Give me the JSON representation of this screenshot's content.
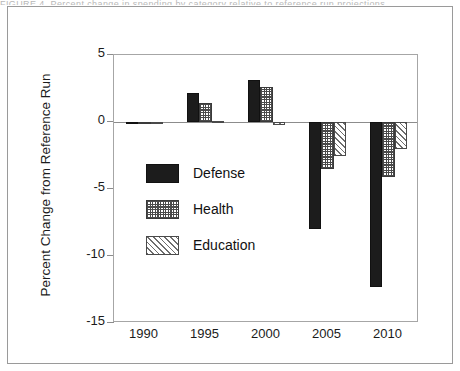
{
  "figure": {
    "caption_fragment": "FIGURE 4.  Percent change in spending by category relative to reference run projections"
  },
  "chart_data": {
    "type": "bar",
    "title": "",
    "xlabel": "",
    "ylabel": "Percent Change from Reference Run",
    "categories": [
      "1990",
      "1995",
      "2000",
      "2005",
      "2010"
    ],
    "xtick_labels": [
      "1990",
      "1995",
      "2000",
      "2005",
      "2010"
    ],
    "ytick_labels": [
      "5",
      "0",
      "-5",
      "-10",
      "-15"
    ],
    "ytick_values": [
      5,
      0,
      -5,
      -10,
      -15
    ],
    "ylim": [
      -15,
      5
    ],
    "grid": false,
    "legend_position": "inside-left",
    "series": [
      {
        "name": "Defense",
        "pattern": "solid-black",
        "color": "#1c1c1c",
        "values": [
          -0.15,
          2.2,
          3.1,
          -8.0,
          -12.3
        ]
      },
      {
        "name": "Health",
        "pattern": "cross-hatch-dotted",
        "color": "#4a4a4a",
        "values": [
          -0.1,
          1.4,
          2.6,
          -3.5,
          -4.1
        ]
      },
      {
        "name": "Education",
        "pattern": "diagonal-hatch",
        "color": "#6d6d6d",
        "values": [
          -0.05,
          0.1,
          -0.2,
          -2.5,
          -2.0
        ]
      }
    ]
  }
}
